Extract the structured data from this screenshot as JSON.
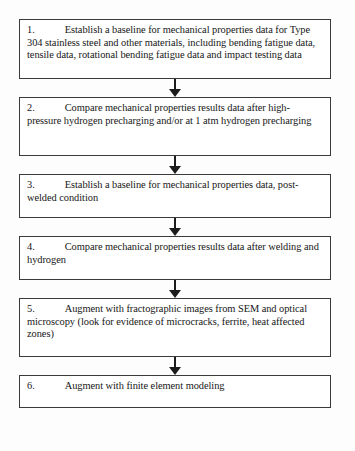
{
  "document": {
    "type": "flowchart",
    "orientation": "vertical",
    "title": "Research task flowchart",
    "background_color": "#fdfdfd",
    "border_color": "#3a3a3a",
    "text_color": "#161616",
    "arrow_color": "#1c1c1c"
  },
  "nodes": [
    {
      "number": "1.",
      "text": "Establish a baseline for mechanical properties data  for Type 304 stainless steel and other materials, including bending fatigue data, tensile data, rotational bending fatigue data and impact testing data"
    },
    {
      "number": "2.",
      "text": "Compare mechanical properties results data after high-pressure hydrogen precharging and/or at 1 atm hydrogen precharging"
    },
    {
      "number": "3.",
      "text": "Establish a baseline for mechanical properties data, post-welded condition"
    },
    {
      "number": "4.",
      "text": "Compare mechanical properties results data after welding and hydrogen"
    },
    {
      "number": "5.",
      "text": "Augment with fractographic images from SEM and optical microscopy (look for evidence of microcracks, ferrite, heat affected zones)"
    },
    {
      "number": "6.",
      "text": "Augment with finite element modeling"
    }
  ],
  "connectors": [
    {
      "from": "1",
      "to": "2",
      "style": "arrow-down"
    },
    {
      "from": "2",
      "to": "3",
      "style": "arrow-down"
    },
    {
      "from": "3",
      "to": "4",
      "style": "arrow-down"
    },
    {
      "from": "4",
      "to": "5",
      "style": "arrow-down"
    },
    {
      "from": "5",
      "to": "6",
      "style": "arrow-down"
    }
  ]
}
